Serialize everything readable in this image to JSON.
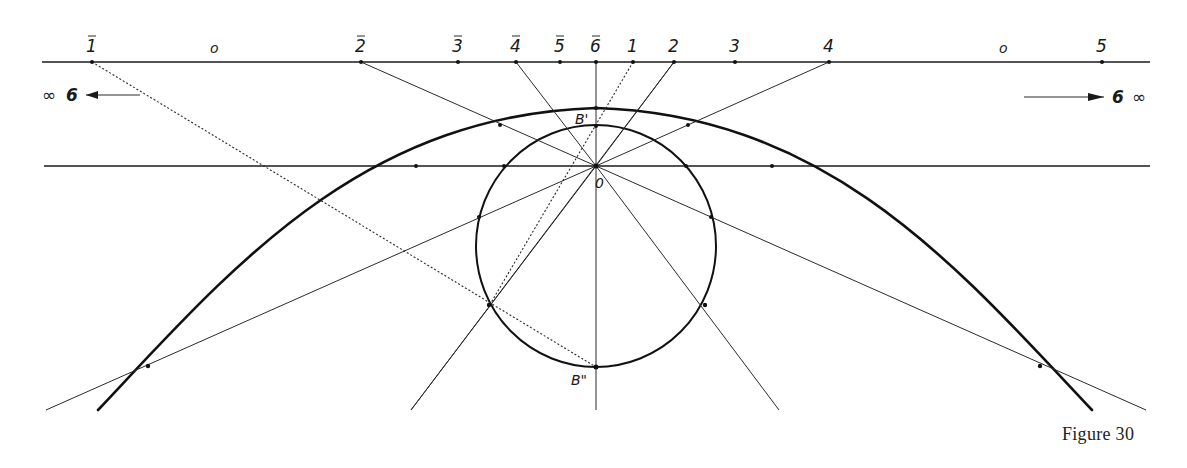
{
  "figure": {
    "caption": "Figure 30",
    "top_line_labels": [
      {
        "id": "1bar",
        "text": "1",
        "bar": true,
        "x": 92
      },
      {
        "id": "o-left",
        "text": "o",
        "bar": false,
        "x": 215
      },
      {
        "id": "2bar",
        "text": "2",
        "bar": true,
        "x": 361
      },
      {
        "id": "3bar",
        "text": "3",
        "bar": true,
        "x": 458
      },
      {
        "id": "4bar",
        "text": "4",
        "bar": true,
        "x": 516
      },
      {
        "id": "5bar",
        "text": "5",
        "bar": true,
        "x": 560
      },
      {
        "id": "6bar",
        "text": "6",
        "bar": true,
        "x": 596
      },
      {
        "id": "1",
        "text": "1",
        "bar": false,
        "x": 633
      },
      {
        "id": "2",
        "text": "2",
        "bar": false,
        "x": 674
      },
      {
        "id": "3",
        "text": "3",
        "bar": false,
        "x": 735
      },
      {
        "id": "4",
        "text": "4",
        "bar": false,
        "x": 829
      },
      {
        "id": "o-right",
        "text": "o",
        "bar": false,
        "x": 1004
      },
      {
        "id": "5",
        "text": "5",
        "bar": false,
        "x": 1102
      }
    ],
    "left_infinity": {
      "symbol": "∞",
      "digit": "6",
      "arrow": "left"
    },
    "right_infinity": {
      "symbol": "∞",
      "digit": "6",
      "arrow": "right"
    },
    "point_labels": {
      "b_prime": "B'",
      "b_double_prime": "B\"",
      "origin": "0"
    }
  }
}
